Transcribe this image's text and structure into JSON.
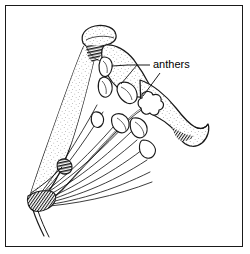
{
  "figure": {
    "kind": "botanical-line-drawing",
    "background_color": "#ffffff",
    "ink_color": "#1a1a1a",
    "frame": {
      "border_color": "#1a1a1a",
      "border_width_px": 1,
      "inset_px": 5
    },
    "annotations": [
      {
        "id": "anthers",
        "label": "anthers",
        "label_x": 153,
        "label_y": 68,
        "leaders": 2
      }
    ],
    "parts": [
      {
        "name": "upper-corolla-lobe"
      },
      {
        "name": "corolla-throat"
      },
      {
        "name": "lower-corolla-lobe"
      },
      {
        "name": "anther-cluster"
      },
      {
        "name": "filament-bundle"
      },
      {
        "name": "style"
      },
      {
        "name": "receptacle-base"
      }
    ]
  }
}
